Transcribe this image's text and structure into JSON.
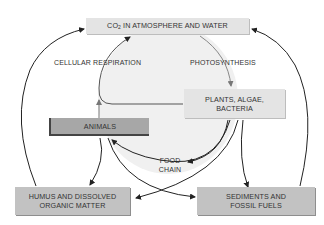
{
  "diagram": {
    "nodes": {
      "co2": {
        "label_prefix": "CO",
        "label_sub": "2",
        "label_rest": " IN ATMOSPHERE AND WATER"
      },
      "plants": {
        "line1": "PLANTS, ALGAE,",
        "line2": "BACTERIA"
      },
      "animals": {
        "label": "ANIMALS"
      },
      "humus": {
        "line1": "HUMUS AND DISSOLVED",
        "line2": "ORGANIC MATTER"
      },
      "sediments": {
        "line1": "SEDIMENTS AND",
        "line2": "FOSSIL FUELS"
      }
    },
    "edge_labels": {
      "respiration": "CELLULAR RESPIRATION",
      "photosynthesis": "PHOTOSYNTHESIS",
      "food_chain_1": "FOOD",
      "food_chain_2": "CHAIN"
    },
    "edges": [
      {
        "from": "co2",
        "to": "plants",
        "label": "PHOTOSYNTHESIS"
      },
      {
        "from": "plants",
        "to": "co2",
        "label": "CELLULAR RESPIRATION"
      },
      {
        "from": "animals",
        "to": "co2",
        "label": "CELLULAR RESPIRATION"
      },
      {
        "from": "plants",
        "to": "animals",
        "label": "FOOD CHAIN"
      },
      {
        "from": "plants",
        "to": "humus"
      },
      {
        "from": "plants",
        "to": "sediments"
      },
      {
        "from": "animals",
        "to": "humus"
      },
      {
        "from": "animals",
        "to": "sediments"
      },
      {
        "from": "humus",
        "to": "co2"
      },
      {
        "from": "sediments",
        "to": "co2"
      }
    ],
    "colors": {
      "background_circle": "#f0f0f0",
      "light_box": "#e4e4e4",
      "mid_box": "#c2c2c2",
      "dark_box": "#a7a7a7",
      "arrow": "#222222",
      "arrow_gray": "#777777"
    }
  }
}
